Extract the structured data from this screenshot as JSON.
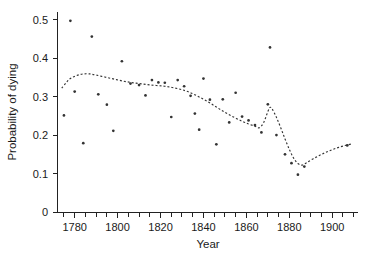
{
  "chart_data": {
    "type": "scatter",
    "title": "",
    "xlabel": "Year",
    "ylabel": "Probability of dying",
    "xlim": [
      1772,
      1912
    ],
    "ylim": [
      0,
      0.52
    ],
    "grid": false,
    "legend": null,
    "x_ticks_major": [
      1780,
      1800,
      1820,
      1840,
      1860,
      1880,
      1900
    ],
    "x_tick_labels": [
      "1780",
      "1800",
      "1820",
      "1840",
      "1860",
      "1880",
      "1900"
    ],
    "x_ticks_minor_step": 5,
    "y_ticks": [
      0,
      0.1,
      0.2,
      0.3,
      0.4,
      0.5
    ],
    "y_tick_labels": [
      "0",
      "0.1",
      "0.2",
      "0.3",
      "0.4",
      "0.5"
    ],
    "marker": "dot",
    "marker_color": "#333333",
    "curve_style": "dashed",
    "curve_color": "#333333",
    "points": [
      {
        "x": 1775,
        "y": 0.251
      },
      {
        "x": 1778,
        "y": 0.497
      },
      {
        "x": 1780,
        "y": 0.313
      },
      {
        "x": 1784,
        "y": 0.179
      },
      {
        "x": 1788,
        "y": 0.456
      },
      {
        "x": 1791,
        "y": 0.306
      },
      {
        "x": 1795,
        "y": 0.279
      },
      {
        "x": 1798,
        "y": 0.211
      },
      {
        "x": 1802,
        "y": 0.392
      },
      {
        "x": 1806,
        "y": 0.334
      },
      {
        "x": 1810,
        "y": 0.33
      },
      {
        "x": 1813,
        "y": 0.303
      },
      {
        "x": 1816,
        "y": 0.343
      },
      {
        "x": 1819,
        "y": 0.337
      },
      {
        "x": 1822,
        "y": 0.336
      },
      {
        "x": 1825,
        "y": 0.247
      },
      {
        "x": 1828,
        "y": 0.343
      },
      {
        "x": 1831,
        "y": 0.327
      },
      {
        "x": 1834,
        "y": 0.302
      },
      {
        "x": 1836,
        "y": 0.256
      },
      {
        "x": 1838,
        "y": 0.214
      },
      {
        "x": 1840,
        "y": 0.347
      },
      {
        "x": 1843,
        "y": 0.292
      },
      {
        "x": 1846,
        "y": 0.176
      },
      {
        "x": 1849,
        "y": 0.293
      },
      {
        "x": 1852,
        "y": 0.233
      },
      {
        "x": 1855,
        "y": 0.31
      },
      {
        "x": 1858,
        "y": 0.248
      },
      {
        "x": 1861,
        "y": 0.238
      },
      {
        "x": 1864,
        "y": 0.226
      },
      {
        "x": 1867,
        "y": 0.207
      },
      {
        "x": 1870,
        "y": 0.28
      },
      {
        "x": 1871,
        "y": 0.428
      },
      {
        "x": 1874,
        "y": 0.2
      },
      {
        "x": 1878,
        "y": 0.15
      },
      {
        "x": 1881,
        "y": 0.127
      },
      {
        "x": 1884,
        "y": 0.097
      },
      {
        "x": 1887,
        "y": 0.118
      },
      {
        "x": 1907,
        "y": 0.173
      }
    ],
    "smooth_curve": [
      {
        "x": 1774,
        "y": 0.322
      },
      {
        "x": 1776,
        "y": 0.336
      },
      {
        "x": 1778,
        "y": 0.347
      },
      {
        "x": 1781,
        "y": 0.355
      },
      {
        "x": 1784,
        "y": 0.359
      },
      {
        "x": 1787,
        "y": 0.359
      },
      {
        "x": 1790,
        "y": 0.356
      },
      {
        "x": 1794,
        "y": 0.351
      },
      {
        "x": 1798,
        "y": 0.346
      },
      {
        "x": 1802,
        "y": 0.341
      },
      {
        "x": 1806,
        "y": 0.337
      },
      {
        "x": 1810,
        "y": 0.334
      },
      {
        "x": 1814,
        "y": 0.331
      },
      {
        "x": 1818,
        "y": 0.329
      },
      {
        "x": 1822,
        "y": 0.327
      },
      {
        "x": 1826,
        "y": 0.323
      },
      {
        "x": 1830,
        "y": 0.318
      },
      {
        "x": 1834,
        "y": 0.31
      },
      {
        "x": 1838,
        "y": 0.299
      },
      {
        "x": 1842,
        "y": 0.287
      },
      {
        "x": 1846,
        "y": 0.273
      },
      {
        "x": 1850,
        "y": 0.259
      },
      {
        "x": 1854,
        "y": 0.247
      },
      {
        "x": 1858,
        "y": 0.236
      },
      {
        "x": 1861,
        "y": 0.229
      },
      {
        "x": 1864,
        "y": 0.223
      },
      {
        "x": 1866,
        "y": 0.219
      },
      {
        "x": 1868,
        "y": 0.232
      },
      {
        "x": 1870,
        "y": 0.261
      },
      {
        "x": 1871,
        "y": 0.272
      },
      {
        "x": 1872,
        "y": 0.268
      },
      {
        "x": 1874,
        "y": 0.246
      },
      {
        "x": 1876,
        "y": 0.219
      },
      {
        "x": 1878,
        "y": 0.19
      },
      {
        "x": 1880,
        "y": 0.163
      },
      {
        "x": 1882,
        "y": 0.14
      },
      {
        "x": 1884,
        "y": 0.126
      },
      {
        "x": 1886,
        "y": 0.122
      },
      {
        "x": 1888,
        "y": 0.128
      },
      {
        "x": 1891,
        "y": 0.138
      },
      {
        "x": 1894,
        "y": 0.147
      },
      {
        "x": 1897,
        "y": 0.155
      },
      {
        "x": 1900,
        "y": 0.162
      },
      {
        "x": 1903,
        "y": 0.168
      },
      {
        "x": 1906,
        "y": 0.173
      },
      {
        "x": 1909,
        "y": 0.177
      }
    ]
  }
}
